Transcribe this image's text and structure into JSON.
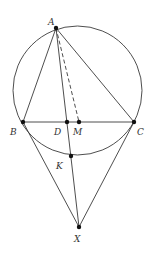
{
  "diagram": {
    "colors": {
      "stroke": "#3a3a3a",
      "point": "#111111",
      "label": "#333333",
      "background": "#ffffff"
    },
    "points": [
      {
        "id": "A",
        "label": "A"
      },
      {
        "id": "B",
        "label": "B"
      },
      {
        "id": "C",
        "label": "C"
      },
      {
        "id": "D",
        "label": "D"
      },
      {
        "id": "M",
        "label": "M"
      },
      {
        "id": "K",
        "label": "K"
      },
      {
        "id": "X",
        "label": "X"
      }
    ],
    "segments": [
      {
        "from": "A",
        "to": "B",
        "style": "solid"
      },
      {
        "from": "A",
        "to": "C",
        "style": "solid"
      },
      {
        "from": "B",
        "to": "C",
        "style": "solid"
      },
      {
        "from": "A",
        "to": "X",
        "style": "solid",
        "passes_through": [
          "D",
          "K"
        ]
      },
      {
        "from": "A",
        "to": "M",
        "style": "dashed"
      },
      {
        "from": "B",
        "to": "X",
        "style": "solid"
      },
      {
        "from": "C",
        "to": "X",
        "style": "solid"
      }
    ],
    "circles": [
      {
        "name": "circumcircle",
        "through": [
          "A",
          "B",
          "C",
          "K"
        ]
      }
    ]
  }
}
